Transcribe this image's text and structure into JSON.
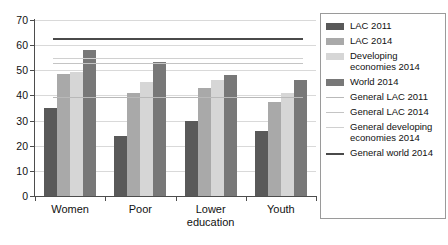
{
  "chart_data": {
    "type": "bar",
    "title": "",
    "xlabel": "",
    "ylabel": "",
    "ylim": [
      0,
      70
    ],
    "ytick_step": 10,
    "grid": true,
    "legend_position": "right",
    "categories": [
      "Women",
      "Poor",
      "Lower education",
      "Youth"
    ],
    "series": [
      {
        "name": "LAC 2011",
        "color": "#595959",
        "values": [
          35,
          24,
          30,
          26
        ]
      },
      {
        "name": "LAC 2014",
        "color": "#a9a9a9",
        "values": [
          48.5,
          41,
          43,
          37.5
        ]
      },
      {
        "name": "Developing economies 2014",
        "color": "#d6d6d6",
        "values": [
          49.5,
          45.5,
          46,
          41
        ]
      },
      {
        "name": "World 2014",
        "color": "#787878",
        "values": [
          58,
          53.5,
          48,
          46
        ]
      }
    ],
    "reference_lines": [
      {
        "name": "General LAC 2011",
        "color": "#b9b9b9",
        "value": 39.5
      },
      {
        "name": "General LAC 2014",
        "color": "#c4c4c4",
        "value": 53
      },
      {
        "name": "General developing economies 2014",
        "color": "#d0d0d0",
        "value": 55
      },
      {
        "name": "General world 2014",
        "color": "#4a4a4a",
        "value": 63
      }
    ],
    "yticks": [
      0,
      10,
      20,
      30,
      40,
      50,
      60,
      70
    ],
    "ytick_labels": [
      "0",
      "10",
      "20",
      "30",
      "40",
      "50",
      "60",
      "70"
    ]
  },
  "legend": {
    "entries": [
      {
        "label": "LAC 2011",
        "kind": "box",
        "color": "#595959"
      },
      {
        "label": "LAC 2014",
        "kind": "box",
        "color": "#a9a9a9"
      },
      {
        "label": "Developing economies 2014",
        "kind": "box",
        "color": "#d6d6d6"
      },
      {
        "label": "World 2014",
        "kind": "box",
        "color": "#787878"
      },
      {
        "label": "General LAC 2011",
        "kind": "line",
        "color": "#b9b9b9"
      },
      {
        "label": "General LAC 2014",
        "kind": "line",
        "color": "#c4c4c4"
      },
      {
        "label": "General developing economies 2014",
        "kind": "line",
        "color": "#d0d0d0"
      },
      {
        "label": "General world 2014",
        "kind": "line-thick",
        "color": "#4a4a4a"
      }
    ]
  },
  "axis": {
    "x_categories": [
      "Women",
      "Poor",
      "Lower education",
      "Youth"
    ]
  }
}
